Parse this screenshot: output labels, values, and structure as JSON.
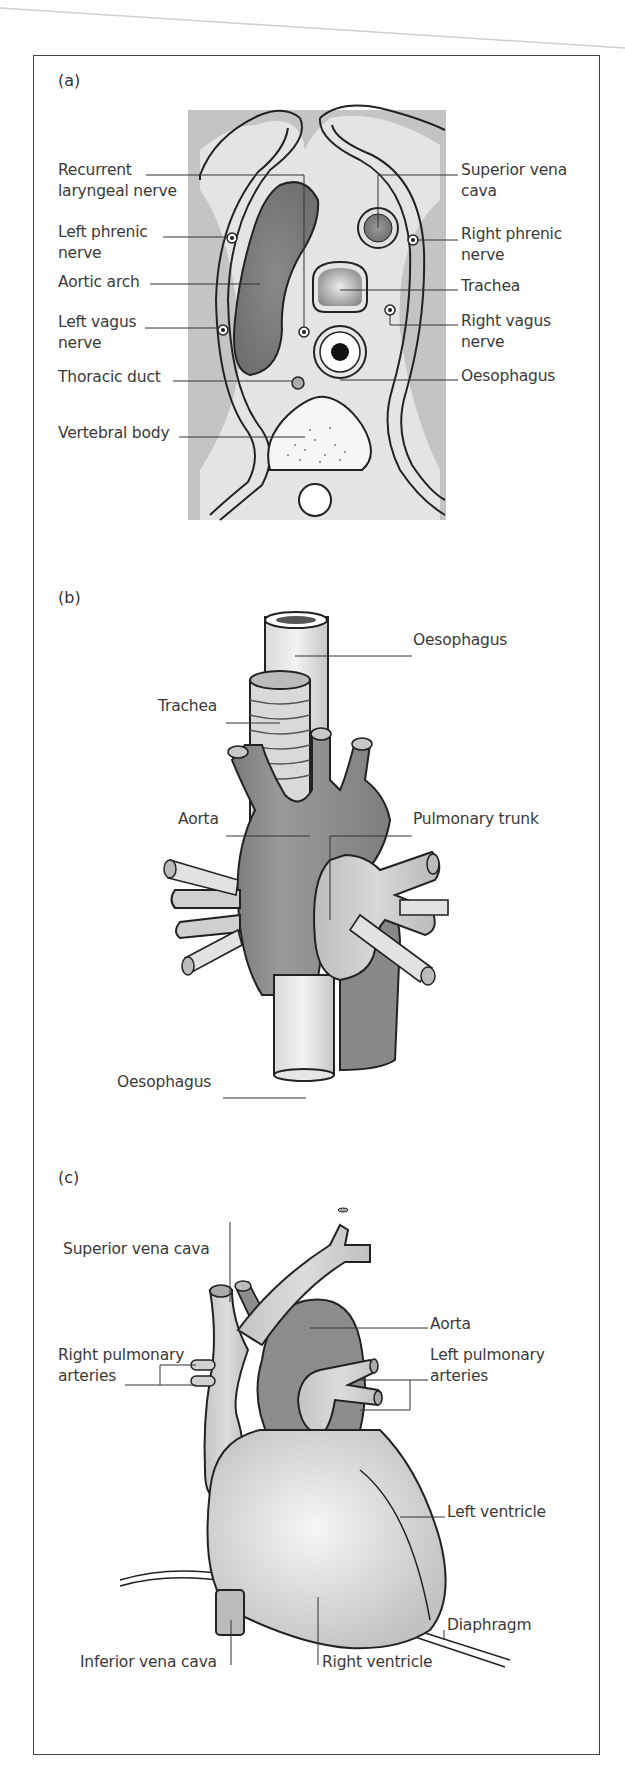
{
  "figure": {
    "panels": [
      {
        "id": "a",
        "letter": "(a)",
        "title": "Transverse section of superior mediastinum",
        "labels_left": [
          {
            "line1": "Recurrent",
            "line2": "laryngeal nerve"
          },
          {
            "line1": "Left phrenic",
            "line2": "nerve"
          },
          {
            "line1": "Aortic arch",
            "line2": ""
          },
          {
            "line1": "Left vagus",
            "line2": "nerve"
          },
          {
            "line1": "Thoracic duct",
            "line2": ""
          },
          {
            "line1": "Vertebral body",
            "line2": ""
          }
        ],
        "labels_right": [
          {
            "line1": "Superior vena",
            "line2": "cava"
          },
          {
            "line1": "Right phrenic",
            "line2": "nerve"
          },
          {
            "line1": "Trachea",
            "line2": ""
          },
          {
            "line1": "Right vagus",
            "line2": "nerve"
          },
          {
            "line1": "Oesophagus",
            "line2": ""
          }
        ]
      },
      {
        "id": "b",
        "letter": "(b)",
        "labels": [
          {
            "text": "Oesophagus"
          },
          {
            "text": "Trachea"
          },
          {
            "text": "Aorta"
          },
          {
            "text": "Pulmonary trunk"
          },
          {
            "text": "Oesophagus"
          }
        ]
      },
      {
        "id": "c",
        "letter": "(c)",
        "labels": [
          {
            "line1": "Superior vena cava",
            "line2": ""
          },
          {
            "line1": "Aorta",
            "line2": ""
          },
          {
            "line1": "Right pulmonary",
            "line2": "arteries"
          },
          {
            "line1": "Left pulmonary",
            "line2": "arteries"
          },
          {
            "line1": "Left ventricle",
            "line2": ""
          },
          {
            "line1": "Diaphragm",
            "line2": ""
          },
          {
            "line1": "Inferior vena cava",
            "line2": ""
          },
          {
            "line1": "Right ventricle",
            "line2": ""
          }
        ]
      }
    ],
    "colors": {
      "frame": "#444444",
      "line": "#222222",
      "dark_tissue": "#8a8a8a",
      "mid_tissue": "#b4b4b4",
      "light_tissue": "#dedede",
      "background_gray": "#c8c8c8",
      "text": "#3a3a3a"
    }
  }
}
